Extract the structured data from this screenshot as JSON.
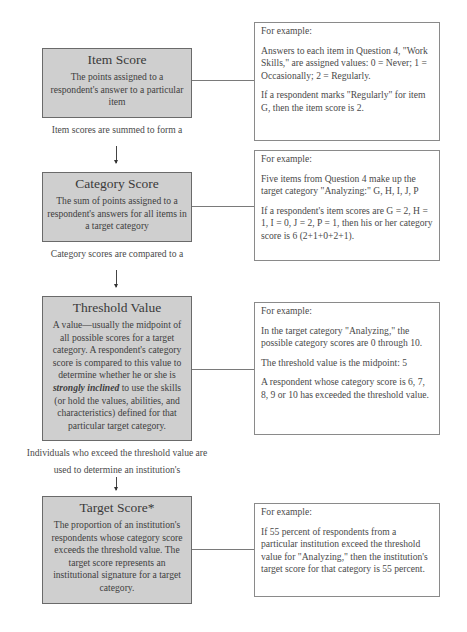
{
  "steps": [
    {
      "title": "Item Score",
      "description": "The points assigned to a respondent's answer to a particular item",
      "caption_after": "Item scores are summed to form a",
      "example": {
        "heading": "For example:",
        "paragraphs": [
          "Answers to each item in Question 4, \"Work Skills,\" are assigned values: 0 = Never; 1 = Occasionally; 2 = Regularly.",
          "If a respondent marks \"Regularly\" for item G, then the item score is 2."
        ]
      }
    },
    {
      "title": "Category Score",
      "description": "The sum of points assigned to a respondent's answers for all items in a target category",
      "caption_after": "Category scores are compared to a",
      "example": {
        "heading": "For example:",
        "paragraphs": [
          "Five items from Question 4 make up the target category \"Analyzing:\" G, H, I, J, P",
          "If a respondent's item scores are G = 2, H = 1, I = 0, J = 2, P = 1, then his or her category score is 6 (2+1+0+2+1)."
        ]
      }
    },
    {
      "title": "Threshold Value",
      "description_pre": "A value—usually the midpoint of all possible scores for a target category. A respondent's category score is compared to this value to determine whether he or she is ",
      "description_emphasis": "strongly inclined",
      "description_post": " to use the skills (or hold the values, abilities, and characteristics) defined for that particular target category.",
      "caption_after_line1": "Individuals who exceed the threshold value are",
      "caption_after_line2": "used to determine an institution's",
      "example": {
        "heading": "For example:",
        "paragraphs": [
          "In the target category \"Analyzing,\" the possible category scores are 0 through 10.",
          "The threshold value is the midpoint: 5",
          "A respondent whose category score is 6, 7, 8, 9 or 10 has exceeded the threshold value."
        ]
      }
    },
    {
      "title": "Target Score*",
      "description": "The proportion of an institution's respondents whose category score exceeds the threshold value. The target score represents an institutional signature for a target category.",
      "example": {
        "heading": "For example:",
        "paragraphs": [
          "If 55 percent of respondents from a particular institution exceed the threshold value for \"Analyzing,\" then the institution's target score for that category is 55 percent."
        ]
      }
    }
  ],
  "colors": {
    "concept_box_fill": "#cfcfcf",
    "concept_box_border": "#6a6a6a",
    "example_box_border": "#8a8a8a",
    "text": "#3a3a3a"
  }
}
